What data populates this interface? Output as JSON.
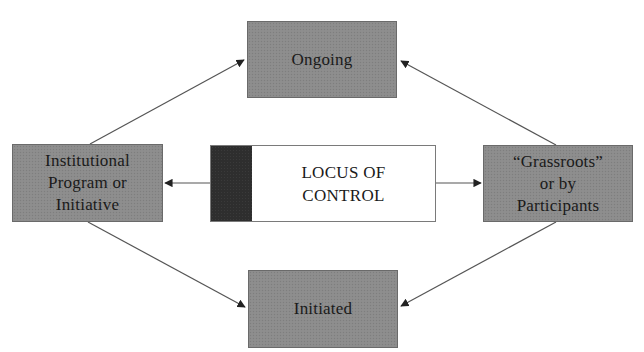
{
  "diagram": {
    "center": {
      "lines": [
        "LOCUS OF",
        "CONTROL"
      ]
    },
    "nodes": {
      "top": {
        "lines": [
          "Ongoing"
        ]
      },
      "bottom": {
        "lines": [
          "Initiated"
        ]
      },
      "left": {
        "lines": [
          "Institutional",
          "Program or",
          "Initiative"
        ]
      },
      "right": {
        "lines": [
          "“Grassroots”",
          "or by",
          "Participants"
        ]
      }
    },
    "edges": [
      {
        "from": "center",
        "to": "left"
      },
      {
        "from": "center",
        "to": "right"
      },
      {
        "from": "left",
        "to": "top"
      },
      {
        "from": "right",
        "to": "top"
      },
      {
        "from": "left",
        "to": "bottom"
      },
      {
        "from": "right",
        "to": "bottom"
      }
    ],
    "colors": {
      "node_fill": "#8c8c8c",
      "strip_fill": "#2e2e2e",
      "center_fill": "#ffffff",
      "line": "#555555"
    }
  }
}
